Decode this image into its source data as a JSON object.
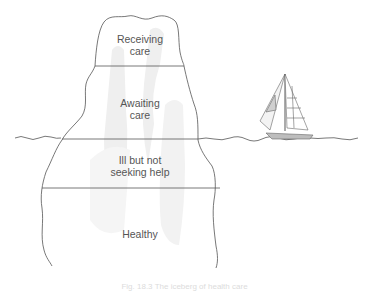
{
  "diagram": {
    "layers": [
      {
        "label": "Receiving\ncare",
        "position": "above water, top"
      },
      {
        "label": "Awaiting\ncare",
        "position": "above water"
      },
      {
        "label": "Ill but not\nseeking help",
        "position": "below water"
      },
      {
        "label": "Healthy",
        "position": "below water, bottom"
      }
    ],
    "icons": {
      "boat": "sailboat-icon",
      "water": "waterline"
    },
    "caption": "Fig. 18.3 The iceberg of health care",
    "colors": {
      "line": "#555555",
      "shadow": "#eeeeee",
      "text": "#555555"
    }
  }
}
